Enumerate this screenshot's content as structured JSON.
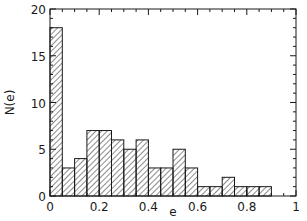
{
  "chart_data": {
    "type": "bar",
    "subtype": "histogram",
    "title": "",
    "xlabel": "e",
    "ylabel": "N(e)",
    "xlim": [
      0,
      1
    ],
    "ylim": [
      0,
      20
    ],
    "bin_width": 0.05,
    "bin_edges": [
      0,
      0.05,
      0.1,
      0.15,
      0.2,
      0.25,
      0.3,
      0.35,
      0.4,
      0.45,
      0.5,
      0.55,
      0.6,
      0.65,
      0.7,
      0.75,
      0.8,
      0.85,
      0.9
    ],
    "values": [
      18,
      3,
      4,
      7,
      7,
      6,
      5,
      6,
      3,
      3,
      5,
      3,
      1,
      1,
      2,
      1,
      1,
      1
    ],
    "x_ticks": [
      "0",
      "0.2",
      "0.4",
      "0.6",
      "0.8",
      "1"
    ],
    "y_ticks": [
      "0",
      "5",
      "10",
      "15",
      "20"
    ],
    "fill": "diagonal hatch",
    "grid": false,
    "legend": null
  },
  "colors": {
    "ink": "#1a1a1a",
    "background": "#ffffff"
  }
}
